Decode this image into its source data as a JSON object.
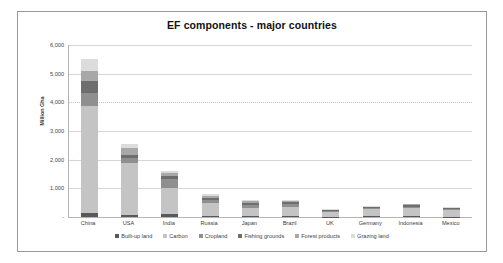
{
  "chart_data": {
    "type": "bar",
    "subtype": "stacked-column",
    "title": "EF components - major countries",
    "xlabel": "",
    "ylabel": "Million Gha",
    "ylim": [
      0,
      6000
    ],
    "ytick_labels": [
      "6,000",
      "5,000",
      "4,000",
      "3,000",
      "2,000",
      "1,000",
      "-"
    ],
    "ytick_values": [
      6000,
      5000,
      4000,
      3000,
      2000,
      1000,
      0
    ],
    "grid": true,
    "legend_position": "bottom",
    "categories": [
      "China",
      "USA",
      "India",
      "Russia",
      "Japan",
      "Brazil",
      "UK",
      "Germany",
      "Indonesia",
      "Mexico"
    ],
    "series": [
      {
        "name": "Built-up land",
        "color": "#595959",
        "values": [
          140,
          55,
          95,
          25,
          20,
          35,
          12,
          18,
          22,
          15
        ]
      },
      {
        "name": "Carbon",
        "color": "#c4c4c4",
        "values": [
          3750,
          1840,
          900,
          480,
          300,
          330,
          170,
          250,
          280,
          215
        ]
      },
      {
        "name": "Cropland",
        "color": "#8f8f8f",
        "values": [
          440,
          175,
          320,
          95,
          95,
          105,
          38,
          45,
          65,
          50
        ]
      },
      {
        "name": "Fishing grounds",
        "color": "#6e6e6e",
        "values": [
          430,
          110,
          125,
          55,
          85,
          45,
          18,
          20,
          40,
          20
        ]
      },
      {
        "name": "Forest products",
        "color": "#a8a8a8",
        "values": [
          330,
          215,
          95,
          95,
          70,
          45,
          22,
          27,
          38,
          27
        ]
      },
      {
        "name": "Grazing land",
        "color": "#dcdcdc",
        "values": [
          410,
          155,
          55,
          40,
          20,
          40,
          10,
          10,
          15,
          13
        ]
      }
    ],
    "totals": [
      5500,
      2550,
      1590,
      790,
      590,
      600,
      270,
      370,
      460,
      340
    ]
  },
  "colors": {
    "frame_border": "#9a9a9a",
    "axis_line": "#b4b4b4",
    "gridline": "#d6d6d6",
    "text": "#333333",
    "background": "#ffffff"
  }
}
